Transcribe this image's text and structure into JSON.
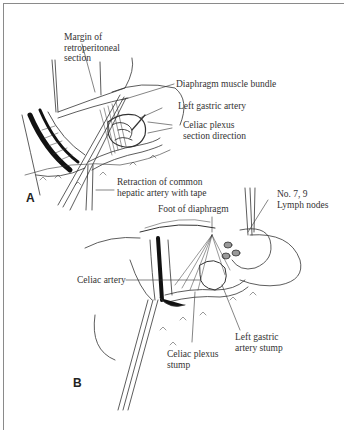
{
  "figure": {
    "panels": [
      {
        "id": "A",
        "label": "A",
        "annotations": [
          {
            "id": "margin",
            "text": "Margin of\nretroperitoneal\nsection"
          },
          {
            "id": "diaphragm-bundle",
            "text": "Diaphragm muscle bundle"
          },
          {
            "id": "left-gastric",
            "text": "Left gastric artery"
          },
          {
            "id": "celiac-plexus-dir",
            "text": "Celiac plexus\nsection direction"
          },
          {
            "id": "retraction",
            "text": "Retraction of common\nhepatic artery with tape"
          }
        ]
      },
      {
        "id": "B",
        "label": "B",
        "annotations": [
          {
            "id": "foot-diaphragm",
            "text": "Foot of diaphragm"
          },
          {
            "id": "lymph-nodes",
            "text": "No. 7, 9\nLymph nodes"
          },
          {
            "id": "celiac-artery",
            "text": "Celiac artery"
          },
          {
            "id": "left-gastric-stump",
            "text": "Left gastric\nartery stump"
          },
          {
            "id": "celiac-plexus-stump",
            "text": "Celiac plexus\nstump"
          }
        ]
      }
    ]
  }
}
